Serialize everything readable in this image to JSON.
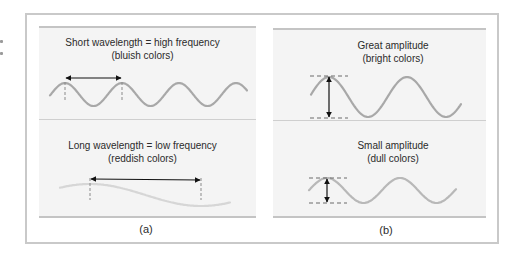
{
  "figure": {
    "panel_a": {
      "label": "(a)",
      "top": {
        "title": "Short wavelength = high frequency",
        "subtitle": "(bluish colors)",
        "measure": "wavelength"
      },
      "bottom": {
        "title": "Long wavelength = low frequency",
        "subtitle": "(reddish colors)",
        "measure": "wavelength"
      }
    },
    "panel_b": {
      "label": "(b)",
      "top": {
        "title": "Great amplitude",
        "subtitle": "(bright colors)",
        "measure": "amplitude"
      },
      "bottom": {
        "title": "Small amplitude",
        "subtitle": "(dull colors)",
        "measure": "amplitude"
      }
    },
    "colors": {
      "short_wave": "#a8a8a8",
      "long_wave": "#d6d6d6",
      "great_amp_wave": "#a8a8a8",
      "small_amp_wave": "#b8b8b8",
      "arrow": "#111111",
      "dashes": "#8a8a8a"
    }
  }
}
